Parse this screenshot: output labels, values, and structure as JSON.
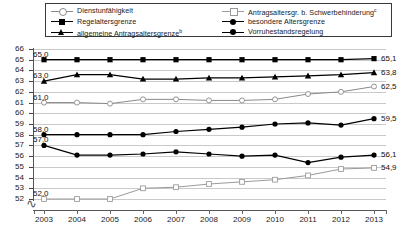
{
  "legend": {
    "items": [
      {
        "label": "Dienstunfähigkeit",
        "sup": "",
        "marker": "open-circle",
        "color": "#8a8a8a",
        "col": 1
      },
      {
        "label": "Regelaltersgrenze",
        "sup": "",
        "marker": "filled-square",
        "color": "#000000",
        "col": 1
      },
      {
        "label": "allgemeine Antragsaltersgrenze",
        "sup": "b",
        "marker": "filled-triangle",
        "color": "#000000",
        "col": 1
      },
      {
        "label": "Antragsaltersgr. b. Schwerbehinderung",
        "sup": "c",
        "marker": "open-square",
        "color": "#9a9a9a",
        "col": 2
      },
      {
        "label": "besondere Altersgrenze",
        "sup": "",
        "marker": "filled-circle",
        "color": "#000000",
        "col": 2
      },
      {
        "label": "Vorruhestandsregelung",
        "sup": "",
        "marker": "filled-circle",
        "color": "#000000",
        "col": 2
      }
    ]
  },
  "chart_data": {
    "type": "line",
    "title": "",
    "xlabel": "",
    "ylabel": "",
    "ylim": [
      52,
      66
    ],
    "yticks": [
      52,
      53,
      54,
      55,
      56,
      57,
      58,
      59,
      60,
      61,
      62,
      63,
      64,
      65,
      66
    ],
    "axis_break": true,
    "grid": true,
    "legend_position": "top",
    "categories": [
      "2003",
      "2004",
      "2005",
      "2006",
      "2007",
      "2008",
      "2009",
      "2010",
      "2011",
      "2012",
      "2013"
    ],
    "series": [
      {
        "name": "Regelaltersgrenze",
        "marker": "filled-square",
        "color": "#000000",
        "values": [
          65.0,
          65.0,
          65.0,
          65.0,
          65.0,
          65.0,
          65.0,
          65.0,
          65.0,
          65.0,
          65.1
        ],
        "start_label": "65,0",
        "end_label": "65,1"
      },
      {
        "name": "allgemeine Antragsaltersgrenze",
        "marker": "filled-triangle",
        "color": "#000000",
        "values": [
          63.0,
          63.6,
          63.6,
          63.2,
          63.2,
          63.3,
          63.3,
          63.4,
          63.5,
          63.6,
          63.8
        ],
        "start_label": "63,0",
        "end_label": "63,8"
      },
      {
        "name": "Dienstunfähigkeit",
        "marker": "open-circle",
        "color": "#8a8a8a",
        "values": [
          61.0,
          61.0,
          60.9,
          61.3,
          61.3,
          61.2,
          61.2,
          61.3,
          61.8,
          62.0,
          62.5
        ],
        "start_label": "61,0",
        "end_label": "62,5"
      },
      {
        "name": "Vorruhestandsregelung",
        "marker": "filled-circle",
        "color": "#000000",
        "values": [
          58.0,
          58.0,
          58.0,
          58.0,
          58.3,
          58.5,
          58.7,
          59.0,
          59.1,
          58.9,
          59.5
        ],
        "start_label": "58,0",
        "end_label": "59,5"
      },
      {
        "name": "besondere Altersgrenze",
        "marker": "filled-circle",
        "color": "#000000",
        "values": [
          57.0,
          56.1,
          56.1,
          56.2,
          56.4,
          56.2,
          56.0,
          56.1,
          55.4,
          55.9,
          56.1
        ],
        "start_label": "57,0",
        "end_label": "56,1"
      },
      {
        "name": "Antragsaltersgr. b. Schwerbehinderung",
        "marker": "open-square",
        "color": "#9a9a9a",
        "values": [
          52.0,
          52.0,
          52.0,
          53.0,
          53.1,
          53.4,
          53.6,
          53.8,
          54.2,
          54.8,
          54.9
        ],
        "start_label": "52,0",
        "end_label": "54,9"
      }
    ]
  }
}
